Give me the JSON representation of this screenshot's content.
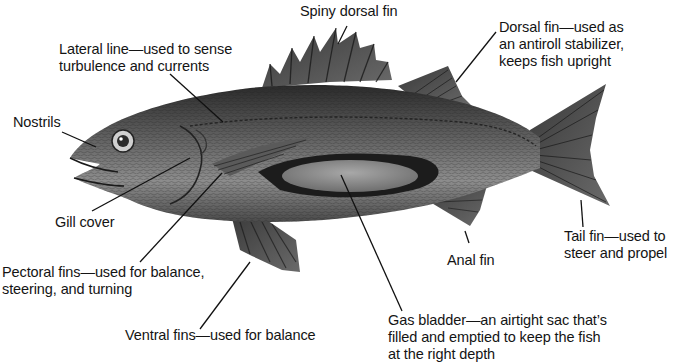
{
  "diagram": {
    "colors": {
      "background": "#ffffff",
      "text": "#141414",
      "leader_line": "#111111",
      "body_dark": "#2e2e2e",
      "body_mid": "#6a6a6a",
      "body_light": "#b9b9b9",
      "bladder": "#8a8a8a"
    },
    "labels": [
      {
        "id": "spiny-dorsal-fin",
        "lines": [
          "Spiny dorsal fin"
        ]
      },
      {
        "id": "lateral-line",
        "lines": [
          "Lateral line—used to sense",
          "turbulence and currents"
        ]
      },
      {
        "id": "dorsal-fin",
        "lines": [
          "Dorsal fin—used as",
          "an antiroll stabilizer,",
          "keeps fish upright"
        ]
      },
      {
        "id": "nostrils",
        "lines": [
          "Nostrils"
        ]
      },
      {
        "id": "gill-cover",
        "lines": [
          "Gill cover"
        ]
      },
      {
        "id": "pectoral-fins",
        "lines": [
          "Pectoral fins—used for balance,",
          "steering, and turning"
        ]
      },
      {
        "id": "ventral-fins",
        "lines": [
          "Ventral fins—used for balance"
        ]
      },
      {
        "id": "anal-fin",
        "lines": [
          "Anal fin"
        ]
      },
      {
        "id": "tail-fin",
        "lines": [
          "Tail fin—used to",
          "steer and propel"
        ]
      },
      {
        "id": "gas-bladder",
        "lines": [
          "Gas bladder—an airtight sac that’s",
          "filled and emptied to keep the fish",
          "at the right depth"
        ]
      }
    ]
  }
}
